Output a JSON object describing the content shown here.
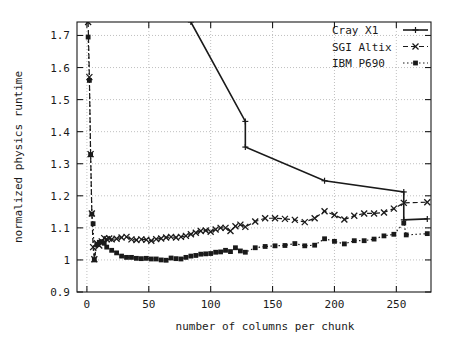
{
  "chart_data": {
    "type": "line",
    "title": "",
    "xlabel": "number of columns per chunk",
    "ylabel": "normalized physics runtime",
    "xlim": [
      -8,
      278
    ],
    "ylim": [
      0.9,
      1.742
    ],
    "xticks": [
      0,
      50,
      100,
      150,
      200,
      250
    ],
    "yticks": [
      0.9,
      1,
      1.1,
      1.2,
      1.3,
      1.4,
      1.5,
      1.6,
      1.7
    ],
    "xtick_labels": [
      "0",
      "50",
      "100",
      "150",
      "200",
      "250"
    ],
    "ytick_labels": [
      "0.9",
      "1",
      "1.1",
      "1.2",
      "1.3",
      "1.4",
      "1.5",
      "1.6",
      "1.7"
    ],
    "grid": true,
    "grid_style": "dotted",
    "legend_position": "top-right",
    "series": [
      {
        "name": "Cray X1",
        "line_style": "solid",
        "marker": "plus",
        "color": "#1a1a1a",
        "points": [
          [
            84,
            1.742
          ],
          [
            128,
            1.432
          ],
          [
            128,
            1.352
          ],
          [
            192,
            1.247
          ],
          [
            256,
            1.212
          ],
          [
            256,
            1.125
          ],
          [
            275,
            1.128
          ]
        ]
      },
      {
        "name": "SGI Altix",
        "line_style": "dashed",
        "marker": "x",
        "color": "#1a1a1a",
        "points": [
          [
            1,
            1.742
          ],
          [
            2,
            1.57
          ],
          [
            3,
            1.33
          ],
          [
            4,
            1.145
          ],
          [
            5,
            1.04
          ],
          [
            6,
            1.002
          ],
          [
            8,
            1.052
          ],
          [
            10,
            1.045
          ],
          [
            12,
            1.058
          ],
          [
            14,
            1.068
          ],
          [
            16,
            1.065
          ],
          [
            18,
            1.067
          ],
          [
            20,
            1.064
          ],
          [
            24,
            1.066
          ],
          [
            28,
            1.07
          ],
          [
            32,
            1.072
          ],
          [
            36,
            1.064
          ],
          [
            40,
            1.062
          ],
          [
            44,
            1.064
          ],
          [
            48,
            1.063
          ],
          [
            52,
            1.06
          ],
          [
            56,
            1.065
          ],
          [
            60,
            1.067
          ],
          [
            64,
            1.07
          ],
          [
            68,
            1.072
          ],
          [
            72,
            1.07
          ],
          [
            76,
            1.072
          ],
          [
            80,
            1.075
          ],
          [
            84,
            1.08
          ],
          [
            88,
            1.085
          ],
          [
            92,
            1.09
          ],
          [
            96,
            1.092
          ],
          [
            100,
            1.088
          ],
          [
            104,
            1.095
          ],
          [
            108,
            1.1
          ],
          [
            112,
            1.1
          ],
          [
            116,
            1.09
          ],
          [
            120,
            1.105
          ],
          [
            124,
            1.11
          ],
          [
            128,
            1.103
          ],
          [
            136,
            1.12
          ],
          [
            144,
            1.13
          ],
          [
            152,
            1.13
          ],
          [
            160,
            1.128
          ],
          [
            168,
            1.125
          ],
          [
            176,
            1.118
          ],
          [
            184,
            1.13
          ],
          [
            192,
            1.152
          ],
          [
            200,
            1.14
          ],
          [
            208,
            1.126
          ],
          [
            216,
            1.138
          ],
          [
            224,
            1.145
          ],
          [
            232,
            1.145
          ],
          [
            240,
            1.148
          ],
          [
            248,
            1.16
          ],
          [
            256,
            1.178
          ],
          [
            275,
            1.18
          ]
        ]
      },
      {
        "name": "IBM P690",
        "line_style": "dotted",
        "marker": "square",
        "color": "#1a1a1a",
        "points": [
          [
            1,
            1.695
          ],
          [
            2,
            1.56
          ],
          [
            3,
            1.328
          ],
          [
            4,
            1.143
          ],
          [
            5,
            1.113
          ],
          [
            6,
            1.0
          ],
          [
            8,
            1.048
          ],
          [
            10,
            1.055
          ],
          [
            12,
            1.057
          ],
          [
            14,
            1.052
          ],
          [
            16,
            1.04
          ],
          [
            20,
            1.03
          ],
          [
            24,
            1.022
          ],
          [
            28,
            1.012
          ],
          [
            32,
            1.008
          ],
          [
            36,
            1.008
          ],
          [
            40,
            1.005
          ],
          [
            44,
            1.004
          ],
          [
            48,
            1.005
          ],
          [
            52,
            1.003
          ],
          [
            56,
            1.003
          ],
          [
            60,
            1.0
          ],
          [
            64,
            0.999
          ],
          [
            68,
            1.006
          ],
          [
            72,
            1.004
          ],
          [
            76,
            1.003
          ],
          [
            80,
            1.008
          ],
          [
            84,
            1.012
          ],
          [
            88,
            1.014
          ],
          [
            92,
            1.018
          ],
          [
            96,
            1.019
          ],
          [
            100,
            1.02
          ],
          [
            104,
            1.024
          ],
          [
            108,
            1.025
          ],
          [
            112,
            1.03
          ],
          [
            116,
            1.026
          ],
          [
            120,
            1.038
          ],
          [
            124,
            1.028
          ],
          [
            128,
            1.024
          ],
          [
            136,
            1.038
          ],
          [
            144,
            1.042
          ],
          [
            152,
            1.044
          ],
          [
            160,
            1.045
          ],
          [
            168,
            1.051
          ],
          [
            176,
            1.044
          ],
          [
            184,
            1.046
          ],
          [
            192,
            1.066
          ],
          [
            200,
            1.058
          ],
          [
            208,
            1.05
          ],
          [
            216,
            1.06
          ],
          [
            224,
            1.06
          ],
          [
            232,
            1.065
          ],
          [
            240,
            1.075
          ],
          [
            248,
            1.08
          ],
          [
            256,
            1.115
          ],
          [
            258,
            1.078
          ],
          [
            275,
            1.082
          ]
        ]
      }
    ]
  },
  "legend": {
    "entries": [
      {
        "label": "Cray X1"
      },
      {
        "label": "SGI Altix"
      },
      {
        "label": "IBM P690"
      }
    ]
  },
  "axes": {
    "x_title": "number of columns per chunk",
    "y_title": "normalized physics runtime"
  }
}
